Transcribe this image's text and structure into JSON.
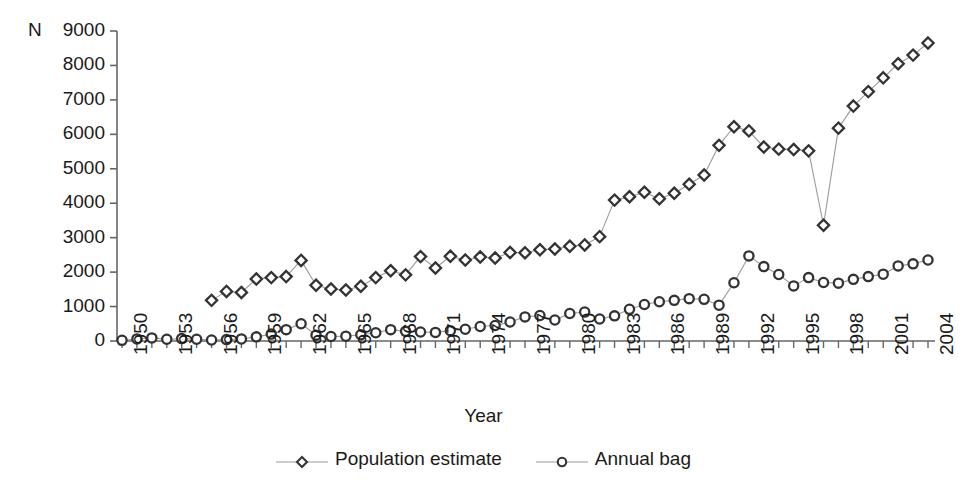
{
  "chart_data": {
    "type": "line",
    "title": "",
    "xlabel": "Year",
    "ylabel": "N",
    "ylim": [
      0,
      9000
    ],
    "xlim": [
      1950,
      2004
    ],
    "grid": false,
    "legend_position": "bottom-center",
    "y_ticks": [
      0,
      1000,
      2000,
      3000,
      4000,
      5000,
      6000,
      7000,
      8000,
      9000
    ],
    "x_tick_labels": [
      "1950",
      "1953",
      "1956",
      "1959",
      "1962",
      "1965",
      "1968",
      "1971",
      "1974",
      "1977",
      "1980",
      "1983",
      "1986",
      "1989",
      "1992",
      "1995",
      "1998",
      "2001",
      "2004"
    ],
    "x": [
      1950,
      1951,
      1952,
      1953,
      1954,
      1955,
      1956,
      1957,
      1958,
      1959,
      1960,
      1961,
      1962,
      1963,
      1964,
      1965,
      1966,
      1967,
      1968,
      1969,
      1970,
      1971,
      1972,
      1973,
      1974,
      1975,
      1976,
      1977,
      1978,
      1979,
      1980,
      1981,
      1982,
      1983,
      1984,
      1985,
      1986,
      1987,
      1988,
      1989,
      1990,
      1991,
      1992,
      1993,
      1994,
      1995,
      1996,
      1997,
      1998,
      1999,
      2000,
      2001,
      2002,
      2003,
      2004
    ],
    "series": [
      {
        "name": "Population estimate",
        "marker": "diamond",
        "color": "#333333",
        "values": [
          null,
          null,
          null,
          null,
          null,
          null,
          1180,
          1440,
          1410,
          1800,
          1840,
          1870,
          2340,
          1620,
          1510,
          1480,
          1590,
          1840,
          2040,
          1920,
          2450,
          2120,
          2460,
          2350,
          2440,
          2410,
          2570,
          2560,
          2650,
          2670,
          2750,
          2790,
          3030,
          4090,
          4190,
          4320,
          4130,
          4290,
          4550,
          4820,
          5680,
          6220,
          6100,
          5630,
          5570,
          5560,
          5520,
          3360,
          6180,
          6820,
          7240,
          7640,
          8050,
          8300,
          8650
        ]
      },
      {
        "name": "Annual bag",
        "marker": "circle",
        "color": "#333333",
        "values": [
          20,
          60,
          90,
          50,
          70,
          50,
          30,
          40,
          60,
          120,
          200,
          330,
          500,
          170,
          130,
          140,
          180,
          240,
          330,
          280,
          260,
          250,
          300,
          340,
          420,
          450,
          550,
          700,
          740,
          610,
          800,
          840,
          640,
          730,
          920,
          1060,
          1140,
          1180,
          1230,
          1210,
          1040,
          1690,
          2470,
          2160,
          1930,
          1600,
          1840,
          1700,
          1680,
          1790,
          1870,
          1940,
          2180,
          2240,
          2350
        ]
      }
    ]
  },
  "legend": {
    "entries": [
      {
        "label": "Population estimate",
        "marker": "diamond"
      },
      {
        "label": "Annual bag",
        "marker": "circle"
      }
    ]
  },
  "axes": {
    "y_unit_label": "N",
    "x_title": "Year"
  }
}
